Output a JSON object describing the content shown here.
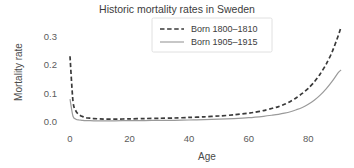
{
  "chart_data": {
    "type": "line",
    "title": "Historic mortality rates in Sweden",
    "xlabel": "Age",
    "ylabel": "Mortality rate",
    "xlim": [
      0,
      92
    ],
    "ylim": [
      0,
      0.35
    ],
    "grid": false,
    "legend_position": "top-center-right",
    "xticks": [
      0,
      20,
      40,
      60,
      80
    ],
    "xtick_labels": [
      "0",
      "20",
      "40",
      "60",
      "80"
    ],
    "yticks": [
      0.0,
      0.1,
      0.2,
      0.3
    ],
    "ytick_labels": [
      "0.0",
      "0.1",
      "0.2",
      "0.3"
    ],
    "series": [
      {
        "name": "Born 1800–1810",
        "style": "dashed",
        "color": "#3a3a3a",
        "x": [
          0,
          1,
          2,
          3,
          4,
          5,
          6,
          7,
          8,
          10,
          12,
          15,
          20,
          25,
          30,
          35,
          40,
          45,
          50,
          55,
          60,
          62,
          65,
          68,
          70,
          72,
          74,
          76,
          78,
          80,
          82,
          84,
          86,
          88,
          90,
          91
        ],
        "values": [
          0.23,
          0.073,
          0.038,
          0.026,
          0.02,
          0.016,
          0.014,
          0.013,
          0.012,
          0.011,
          0.01,
          0.01,
          0.011,
          0.012,
          0.013,
          0.014,
          0.016,
          0.018,
          0.021,
          0.025,
          0.031,
          0.034,
          0.04,
          0.048,
          0.054,
          0.062,
          0.072,
          0.085,
          0.1,
          0.118,
          0.14,
          0.168,
          0.202,
          0.245,
          0.3,
          0.332
        ]
      },
      {
        "name": "Born 1905–1915",
        "style": "solid",
        "color": "#9a9a9a",
        "x": [
          0,
          1,
          2,
          3,
          4,
          5,
          6,
          8,
          10,
          15,
          20,
          25,
          30,
          35,
          40,
          45,
          50,
          55,
          60,
          65,
          68,
          70,
          72,
          74,
          76,
          78,
          80,
          82,
          84,
          86,
          88,
          90,
          91
        ],
        "values": [
          0.08,
          0.02,
          0.01,
          0.007,
          0.006,
          0.005,
          0.005,
          0.004,
          0.004,
          0.004,
          0.005,
          0.005,
          0.006,
          0.006,
          0.007,
          0.008,
          0.01,
          0.012,
          0.015,
          0.02,
          0.024,
          0.027,
          0.031,
          0.036,
          0.043,
          0.051,
          0.062,
          0.076,
          0.094,
          0.116,
          0.142,
          0.172,
          0.182
        ]
      }
    ]
  },
  "layout": {
    "plot_left": 70,
    "plot_right": 344,
    "plot_top": 22,
    "plot_bottom": 122
  }
}
